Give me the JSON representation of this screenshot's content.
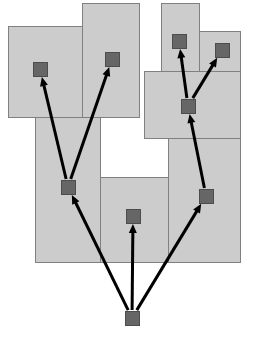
{
  "diagram": {
    "type": "treemap-tree-overlay",
    "canvas": {
      "width": 256,
      "height": 353,
      "background": "#ffffff"
    },
    "style": {
      "region_fill": "#cccccc",
      "region_stroke": "#808080",
      "region_stroke_width": 1,
      "node_fill": "#666666",
      "node_stroke": "#4d4d4d",
      "node_size": 14,
      "edge_color": "#000000",
      "edge_width": 3,
      "arrowhead_length": 9,
      "arrowhead_width": 8
    },
    "regions": [
      {
        "id": "region-top-left",
        "x": 8,
        "y": 26,
        "w": 92,
        "h": 91
      },
      {
        "id": "region-top-mid",
        "x": 82,
        "y": 3,
        "w": 57,
        "h": 114
      },
      {
        "id": "region-top-right-tall",
        "x": 161,
        "y": 3,
        "w": 38,
        "h": 68
      },
      {
        "id": "region-top-far-right",
        "x": 199,
        "y": 31,
        "w": 41,
        "h": 40
      },
      {
        "id": "region-mid-right",
        "x": 144,
        "y": 71,
        "w": 96,
        "h": 67
      },
      {
        "id": "region-lower-left",
        "x": 35,
        "y": 117,
        "w": 65,
        "h": 145
      },
      {
        "id": "region-lower-right",
        "x": 168,
        "y": 138,
        "w": 72,
        "h": 124
      },
      {
        "id": "region-lower-mid",
        "x": 100,
        "y": 177,
        "w": 68,
        "h": 85
      }
    ],
    "nodes": [
      {
        "id": "node-root",
        "label": "root",
        "cx": 132,
        "cy": 318,
        "depth": 0
      },
      {
        "id": "node-left-mid",
        "label": "left-branch",
        "cx": 68,
        "cy": 187,
        "depth": 1
      },
      {
        "id": "node-center-low",
        "label": "center-leaf",
        "cx": 133,
        "cy": 216,
        "depth": 1
      },
      {
        "id": "node-right-mid",
        "label": "right-branch",
        "cx": 206,
        "cy": 196,
        "depth": 1
      },
      {
        "id": "node-top-left",
        "label": "top-left",
        "cx": 40,
        "cy": 69,
        "depth": 2
      },
      {
        "id": "node-top-mid",
        "label": "top-mid",
        "cx": 112,
        "cy": 59,
        "depth": 2
      },
      {
        "id": "node-right-hub",
        "label": "right-hub",
        "cx": 188,
        "cy": 106,
        "depth": 2
      },
      {
        "id": "node-top-right",
        "label": "top-right",
        "cx": 179,
        "cy": 41,
        "depth": 3
      },
      {
        "id": "node-far-right",
        "label": "far-right",
        "cx": 222,
        "cy": 50,
        "depth": 3
      }
    ],
    "edges": [
      {
        "id": "edge-root-to-left",
        "from": "node-root",
        "to": "node-left-mid"
      },
      {
        "id": "edge-root-to-center",
        "from": "node-root",
        "to": "node-center-low"
      },
      {
        "id": "edge-root-to-right",
        "from": "node-root",
        "to": "node-right-mid"
      },
      {
        "id": "edge-left-to-topleft",
        "from": "node-left-mid",
        "to": "node-top-left"
      },
      {
        "id": "edge-left-to-topmid",
        "from": "node-left-mid",
        "to": "node-top-mid"
      },
      {
        "id": "edge-right-to-hub",
        "from": "node-right-mid",
        "to": "node-right-hub"
      },
      {
        "id": "edge-hub-to-topright",
        "from": "node-right-hub",
        "to": "node-top-right"
      },
      {
        "id": "edge-hub-to-farright",
        "from": "node-right-hub",
        "to": "node-far-right"
      }
    ]
  }
}
